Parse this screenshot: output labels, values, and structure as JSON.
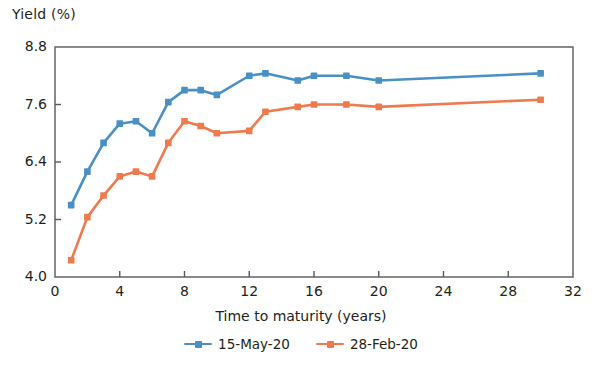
{
  "chart_data": {
    "type": "line",
    "title": "",
    "xlabel": "Time to maturity (years)",
    "ylabel": "Yield (%)",
    "xlim": [
      0,
      32
    ],
    "ylim": [
      4.0,
      8.8
    ],
    "xticks": [
      0,
      4,
      8,
      12,
      16,
      20,
      24,
      28,
      32
    ],
    "xtick_labels": [
      "0",
      "4",
      "8",
      "12",
      "16",
      "20",
      "24",
      "28",
      "32"
    ],
    "yticks": [
      4.0,
      5.2,
      6.4,
      7.6,
      8.8
    ],
    "ytick_labels": [
      "4.0",
      "5.2",
      "6.4",
      "7.6",
      "8.8"
    ],
    "grid": false,
    "legend_position": "bottom-center",
    "markers": "square",
    "x": [
      1,
      2,
      3,
      4,
      5,
      6,
      7,
      8,
      9,
      10,
      12,
      13,
      15,
      16,
      18,
      20,
      30
    ],
    "series": [
      {
        "name": "15-May-20",
        "color": "#4a90c4",
        "values": [
          5.5,
          6.2,
          6.8,
          7.2,
          7.25,
          7.0,
          7.65,
          7.9,
          7.9,
          7.8,
          8.2,
          8.25,
          8.1,
          8.2,
          8.2,
          8.1,
          8.25
        ]
      },
      {
        "name": "28-Feb-20",
        "color": "#ee7a4e",
        "values": [
          4.35,
          5.25,
          5.7,
          6.1,
          6.2,
          6.1,
          6.8,
          7.25,
          7.15,
          7.0,
          7.05,
          7.45,
          7.55,
          7.6,
          7.6,
          7.55,
          7.7
        ]
      }
    ]
  },
  "axes": {
    "y_title": "Yield (%)",
    "x_title": "Time to maturity (years)"
  },
  "legend": {
    "items": [
      {
        "label": "15-May-20",
        "color": "#4a90c4"
      },
      {
        "label": "28-Feb-20",
        "color": "#ee7a4e"
      }
    ]
  },
  "colors": {
    "series_1": "#4a90c4",
    "series_2": "#ee7a4e",
    "axis": "#58595b",
    "text": "#231f20",
    "background": "#ffffff"
  }
}
